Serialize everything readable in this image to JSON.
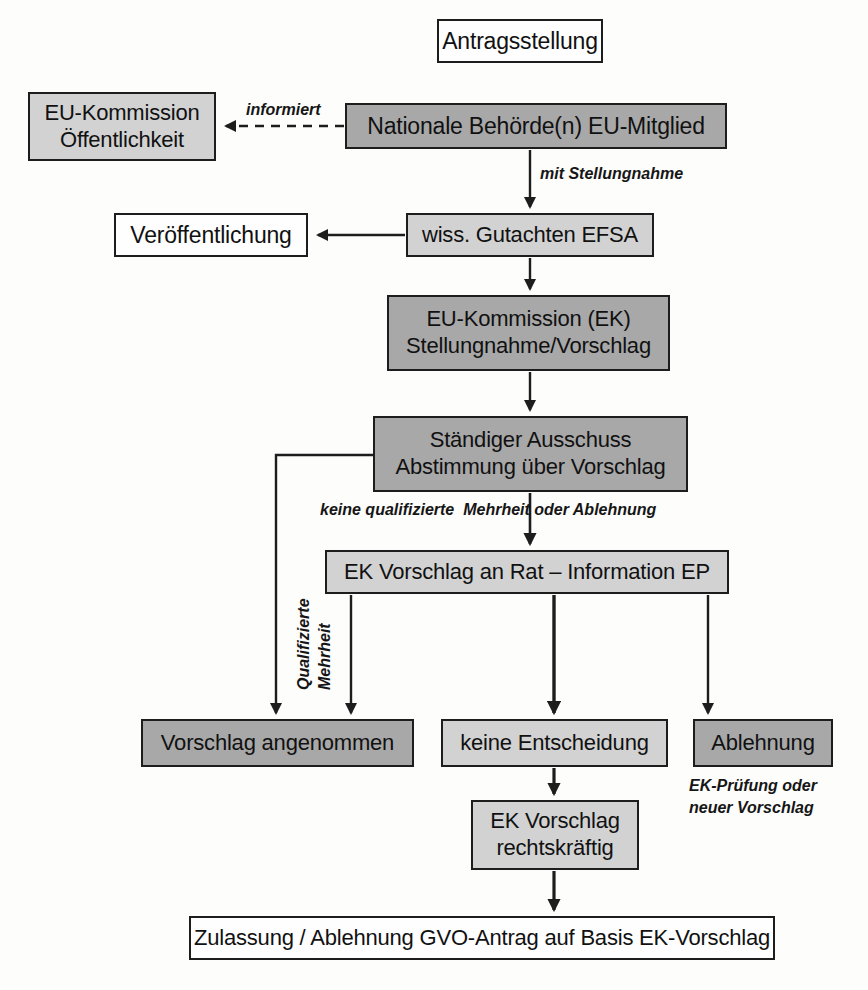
{
  "diagram": {
    "colors": {
      "fill_white": "#fefefe",
      "fill_light_gray": "#d2d2d2",
      "fill_dark_gray": "#a8a8a8",
      "stroke": "#1d1d1d",
      "background": "#fdfdfc"
    },
    "nodes": [
      {
        "id": "antragsstellung",
        "label": "Antragsstellung",
        "fill": "white",
        "x": 437,
        "y": 19,
        "w": 166,
        "h": 44,
        "font_size": 23
      },
      {
        "id": "eu-kommission-oeffentlichkeit",
        "label": "EU-Kommission\nÖffentlichkeit",
        "fill": "light",
        "x": 28,
        "y": 92,
        "w": 188,
        "h": 69,
        "font_size": 22
      },
      {
        "id": "nationale-behoerde",
        "label": "Nationale Behörde(n) EU-Mitglied",
        "fill": "dark",
        "x": 345,
        "y": 103,
        "w": 382,
        "h": 46,
        "font_size": 23
      },
      {
        "id": "veroeffentlichung",
        "label": "Veröffentlichung",
        "fill": "white",
        "x": 114,
        "y": 213,
        "w": 194,
        "h": 44,
        "font_size": 23
      },
      {
        "id": "wiss-gutachten-efsa",
        "label": "wiss. Gutachten EFSA",
        "fill": "light",
        "x": 406,
        "y": 213,
        "w": 248,
        "h": 44,
        "font_size": 22
      },
      {
        "id": "eu-kommission-ek",
        "label": "EU-Kommission (EK)\nStellungnahme/Vorschlag",
        "fill": "dark",
        "x": 387,
        "y": 295,
        "w": 283,
        "h": 76,
        "font_size": 22
      },
      {
        "id": "staendiger-ausschuss",
        "label": "Ständiger Ausschuss\nAbstimmung über Vorschlag",
        "fill": "dark",
        "x": 373,
        "y": 416,
        "w": 315,
        "h": 76,
        "font_size": 22
      },
      {
        "id": "ek-vorschlag-an-rat",
        "label": "EK Vorschlag an Rat – Information EP",
        "fill": "light",
        "x": 325,
        "y": 550,
        "w": 404,
        "h": 44,
        "font_size": 22
      },
      {
        "id": "vorschlag-angenommen",
        "label": "Vorschlag angenommen",
        "fill": "dark",
        "x": 141,
        "y": 719,
        "w": 273,
        "h": 48,
        "font_size": 22
      },
      {
        "id": "keine-entscheidung",
        "label": "keine Entscheidung",
        "fill": "light",
        "x": 441,
        "y": 719,
        "w": 227,
        "h": 48,
        "font_size": 22
      },
      {
        "id": "ablehnung",
        "label": "Ablehnung",
        "fill": "dark",
        "x": 693,
        "y": 719,
        "w": 140,
        "h": 48,
        "font_size": 22
      },
      {
        "id": "ek-vorschlag-rechtskraeftig",
        "label": "EK Vorschlag\nrechtskräftig",
        "fill": "light",
        "x": 471,
        "y": 800,
        "w": 168,
        "h": 70,
        "font_size": 22
      },
      {
        "id": "zulassung-ablehnung",
        "label": "Zulassung / Ablehnung GVO-Antrag auf Basis EK-Vorschlag",
        "fill": "white",
        "x": 189,
        "y": 916,
        "w": 586,
        "h": 44,
        "font_size": 22
      }
    ],
    "edge_labels": [
      {
        "id": "informiert",
        "text": "informiert",
        "x": 246,
        "y": 100,
        "font_size": 16
      },
      {
        "id": "mit-stellungnahme",
        "text": "mit Stellungnahme",
        "x": 540,
        "y": 164,
        "font_size": 16
      },
      {
        "id": "keine-qualifizierte-mehrheit",
        "text": "keine qualifizierte  Mehrheit oder Ablehnung",
        "x": 320,
        "y": 500,
        "font_size": 16
      }
    ],
    "rotated_labels": [
      {
        "id": "qualifizierte-mehrheit",
        "line1": "Qualifizierte",
        "line2": "Mehrheit",
        "x": 292,
        "y": 690,
        "font_size": 16
      }
    ],
    "notes": [
      {
        "id": "ek-pruefung-note",
        "text": "EK-Prüfung oder\nneuer Vorschlag",
        "x": 689,
        "y": 775,
        "font_size": 16
      }
    ]
  }
}
